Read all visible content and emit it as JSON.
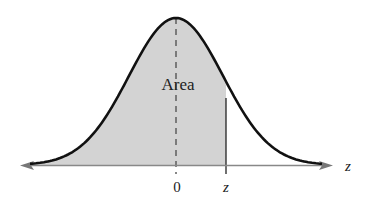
{
  "diagram": {
    "area_label": "Area",
    "axis_label": "z",
    "tick_labels": [
      "0",
      "z"
    ],
    "colors": {
      "curve": "#111111",
      "shade": "#d3d3d3",
      "axis": "#777777"
    }
  },
  "chart_data": {
    "type": "area",
    "xlabel": "z",
    "ylabel": "",
    "annotations": [
      "Area",
      "0",
      "z"
    ],
    "shaded_region": "from -infinity to z",
    "center": 0
  }
}
